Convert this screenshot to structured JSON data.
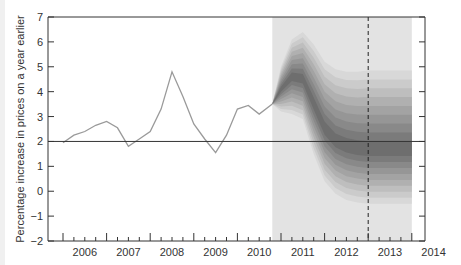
{
  "chart_data": {
    "type": "line",
    "subtype": "fan-chart",
    "title": "",
    "xlabel": "",
    "ylabel": "Percentage increase in prices on a year earlier",
    "ylim": [
      -2,
      7
    ],
    "xlim": [
      2005.66,
      2014.3
    ],
    "y_ticks": [
      "7",
      "6",
      "5",
      "4",
      "3",
      "2",
      "1",
      "0",
      "−1",
      "−2"
    ],
    "y_tick_values": [
      7,
      6,
      5,
      4,
      3,
      2,
      1,
      0,
      -1,
      -2
    ],
    "x_tick_labels": [
      "2006",
      "2007",
      "2008",
      "2009",
      "2010",
      "2011",
      "2012",
      "2013",
      "2014"
    ],
    "grid": false,
    "legend": null,
    "reference_line": {
      "y": 2,
      "label": "target"
    },
    "vertical_dashed_line": {
      "x": 2013.0
    },
    "shaded_projection_region": {
      "from": 2010.8,
      "to": 2014.0
    },
    "series": [
      {
        "name": "CPI inflation (outturn)",
        "x": [
          2006.0,
          2006.25,
          2006.5,
          2006.75,
          2007.0,
          2007.25,
          2007.5,
          2007.75,
          2008.0,
          2008.25,
          2008.5,
          2008.75,
          2009.0,
          2009.25,
          2009.5,
          2009.75,
          2010.0,
          2010.25,
          2010.5,
          2010.8
        ],
        "values": [
          1.95,
          2.25,
          2.4,
          2.65,
          2.8,
          2.55,
          1.8,
          2.1,
          2.4,
          3.3,
          4.8,
          3.8,
          2.7,
          2.1,
          1.55,
          2.25,
          3.3,
          3.45,
          3.1,
          3.5
        ]
      }
    ],
    "fan": {
      "x": [
        2010.8,
        2011.0,
        2011.25,
        2011.5,
        2011.75,
        2012.0,
        2012.25,
        2012.5,
        2012.75,
        2013.0,
        2013.25,
        2013.5,
        2013.75,
        2014.0
      ],
      "central": [
        3.5,
        4.1,
        4.6,
        4.5,
        3.5,
        2.5,
        2.0,
        1.8,
        1.7,
        1.65,
        1.65,
        1.65,
        1.65,
        1.65
      ],
      "upper_90": [
        3.5,
        5.0,
        6.1,
        6.4,
        5.9,
        5.2,
        4.9,
        4.8,
        4.8,
        4.85,
        4.85,
        4.85,
        4.85,
        4.85
      ],
      "lower_90": [
        3.5,
        3.2,
        3.1,
        2.9,
        1.5,
        0.4,
        -0.1,
        -0.35,
        -0.45,
        -0.5,
        -0.5,
        -0.5,
        -0.5,
        -0.5
      ]
    }
  },
  "colors": {
    "line": "#9a9a9a",
    "axis": "#333333",
    "target_line": "#333333",
    "projection_bg": "#e3e3e3",
    "fan_dark": "#6e6e6e",
    "fan_light": "#d8d8d8"
  }
}
